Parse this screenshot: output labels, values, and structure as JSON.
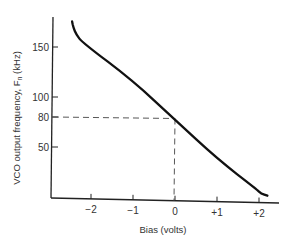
{
  "chart_data": {
    "type": "line",
    "title": "",
    "xlabel": "Bias (volts)",
    "ylabel": "VCO output frequency, F_n (kHz)",
    "ylabel_main": "VCO output frequency, F",
    "ylabel_sub": "n",
    "ylabel_unit": " (kHz)",
    "x_ticks": [
      {
        "value": -2,
        "label": "−2"
      },
      {
        "value": -1,
        "label": "−1"
      },
      {
        "value": 0,
        "label": "0"
      },
      {
        "value": 1,
        "label": "+1"
      },
      {
        "value": 2,
        "label": "+2"
      }
    ],
    "y_ticks": [
      {
        "value": 50,
        "label": "50"
      },
      {
        "value": 80,
        "label": "80"
      },
      {
        "value": 100,
        "label": "100"
      },
      {
        "value": 150,
        "label": "150"
      }
    ],
    "xlim": [
      -2.9,
      2.7
    ],
    "ylim": [
      0,
      185
    ],
    "grid": false,
    "legend": null,
    "series": [
      {
        "name": "VCO transfer curve",
        "x": [
          -2.45,
          -2.42,
          -2.35,
          -2.2,
          -1.0,
          0.0,
          1.0,
          1.95,
          2.05,
          2.2
        ],
        "y": [
          176,
          170,
          163,
          155,
          118,
          80,
          42,
          12,
          8,
          6
        ]
      }
    ],
    "annotations": [
      {
        "type": "dashed-guide",
        "description": "Horizontal dashed line at 80 kHz from y-axis to curve, vertical dashed line at 0 V from curve to x-axis",
        "x": 0,
        "y": 80
      }
    ]
  }
}
